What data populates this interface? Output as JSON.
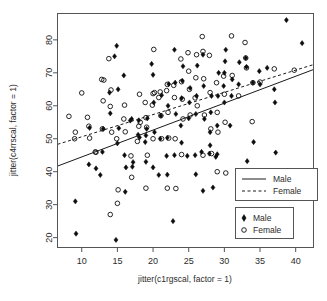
{
  "chart_data": {
    "type": "scatter",
    "title": "",
    "xlabel": "jitter(c1rgscal, factor = 1)",
    "ylabel": "jitter(c4rrscal, factor = 1)",
    "xlim": [
      6.6,
      42.5
    ],
    "ylim": [
      17.0,
      88.0
    ],
    "xticks": [
      10,
      15,
      20,
      25,
      30,
      35,
      40
    ],
    "yticks": [
      20,
      30,
      40,
      50,
      60,
      70,
      80
    ],
    "grid": false,
    "legend_position": "bottom-right",
    "legends": [
      {
        "name": "fit-lines-legend",
        "entries": [
          {
            "label": "Male",
            "style": "solid",
            "color": "#1a1a1a"
          },
          {
            "label": "Female",
            "style": "dashed",
            "color": "#1a1a1a"
          }
        ]
      },
      {
        "name": "points-legend",
        "entries": [
          {
            "label": "Male",
            "marker": "filled-diamond",
            "color": "#0d0d0d"
          },
          {
            "label": "Female",
            "marker": "open-circle",
            "color": "#0d0d0d"
          }
        ]
      }
    ],
    "fit_lines": [
      {
        "name": "Male",
        "style": "solid",
        "x": [
          6.6,
          42.5
        ],
        "y": [
          41.7,
          71.0
        ]
      },
      {
        "name": "Female",
        "style": "dashed",
        "x": [
          6.6,
          42.5
        ],
        "y": [
          48.3,
          72.5
        ]
      }
    ],
    "series": [
      {
        "name": "Male",
        "marker": "filled-diamond",
        "points": [
          [
            9.1,
            31.0
          ],
          [
            9.2,
            21.2
          ],
          [
            11.0,
            42.2
          ],
          [
            11.1,
            53.3
          ],
          [
            12.0,
            41.0
          ],
          [
            12.6,
            39.0
          ],
          [
            12.9,
            46.0
          ],
          [
            13.0,
            53.0
          ],
          [
            14.0,
            57.7
          ],
          [
            14.6,
            75.0
          ],
          [
            14.9,
            78.2
          ],
          [
            14.8,
            19.3
          ],
          [
            15.0,
            48.6
          ],
          [
            15.1,
            65.0
          ],
          [
            15.2,
            53.2
          ],
          [
            15.9,
            69.2
          ],
          [
            16.0,
            45.0
          ],
          [
            16.2,
            41.3
          ],
          [
            16.1,
            33.9
          ],
          [
            16.8,
            55.5
          ],
          [
            17.0,
            56.0
          ],
          [
            17.1,
            41.5
          ],
          [
            17.2,
            42.9
          ],
          [
            17.9,
            51.2
          ],
          [
            18.0,
            55.6
          ],
          [
            18.1,
            50.4
          ],
          [
            18.9,
            49.0
          ],
          [
            19.0,
            51.0
          ],
          [
            19.1,
            53.0
          ],
          [
            19.2,
            56.2
          ],
          [
            19.0,
            43.0
          ],
          [
            19.8,
            72.7
          ],
          [
            20.0,
            69.4
          ],
          [
            20.1,
            61.0
          ],
          [
            20.2,
            52.0
          ],
          [
            20.0,
            41.3
          ],
          [
            20.8,
            39.0
          ],
          [
            21.0,
            50.0
          ],
          [
            21.1,
            57.0
          ],
          [
            21.2,
            63.2
          ],
          [
            21.9,
            44.8
          ],
          [
            22.0,
            50.3
          ],
          [
            22.1,
            60.0
          ],
          [
            22.2,
            66.6
          ],
          [
            22.0,
            39.1
          ],
          [
            22.8,
            25.0
          ],
          [
            23.0,
            77.0
          ],
          [
            23.1,
            67.0
          ],
          [
            23.2,
            57.5
          ],
          [
            23.0,
            45.0
          ],
          [
            23.9,
            54.0
          ],
          [
            24.0,
            62.3
          ],
          [
            24.1,
            67.6
          ],
          [
            24.2,
            72.0
          ],
          [
            24.0,
            48.8
          ],
          [
            24.8,
            44.8
          ],
          [
            25.0,
            56.2
          ],
          [
            25.1,
            61.0
          ],
          [
            25.2,
            65.4
          ],
          [
            25.9,
            45.0
          ],
          [
            26.0,
            57.5
          ],
          [
            26.1,
            63.0
          ],
          [
            26.2,
            72.2
          ],
          [
            26.0,
            39.2
          ],
          [
            26.8,
            46.0
          ],
          [
            27.0,
            75.5
          ],
          [
            27.1,
            66.0
          ],
          [
            27.2,
            56.0
          ],
          [
            27.0,
            34.2
          ],
          [
            27.9,
            45.5
          ],
          [
            28.0,
            52.0
          ],
          [
            28.1,
            58.0
          ],
          [
            28.2,
            63.0
          ],
          [
            28.0,
            48.0
          ],
          [
            28.4,
            35.2
          ],
          [
            28.8,
            44.5
          ],
          [
            29.0,
            54.0
          ],
          [
            29.1,
            63.0
          ],
          [
            29.2,
            70.0
          ],
          [
            29.0,
            45.3
          ],
          [
            29.9,
            66.0
          ],
          [
            30.0,
            70.0
          ],
          [
            30.1,
            73.5
          ],
          [
            30.2,
            77.0
          ],
          [
            30.0,
            61.0
          ],
          [
            30.8,
            54.0
          ],
          [
            31.0,
            63.0
          ],
          [
            31.1,
            68.0
          ],
          [
            32.0,
            66.5
          ],
          [
            32.1,
            73.2
          ],
          [
            33.0,
            74.5
          ],
          [
            33.1,
            71.8
          ],
          [
            33.2,
            43.2
          ],
          [
            34.0,
            67.0
          ],
          [
            34.1,
            49.0
          ],
          [
            34.9,
            70.5
          ],
          [
            35.0,
            66.5
          ],
          [
            36.0,
            71.5
          ],
          [
            37.0,
            65.0
          ],
          [
            37.1,
            61.0
          ],
          [
            37.2,
            45.8
          ],
          [
            38.7,
            86.0
          ],
          [
            40.9,
            79.0
          ],
          [
            13.9,
            64.0
          ]
        ]
      },
      {
        "name": "Female",
        "marker": "open-circle",
        "points": [
          [
            8.2,
            56.8
          ],
          [
            9.0,
            50.0
          ],
          [
            9.1,
            52.0
          ],
          [
            10.0,
            63.9
          ],
          [
            10.8,
            56.5
          ],
          [
            11.0,
            53.8
          ],
          [
            11.1,
            50.2
          ],
          [
            11.9,
            46.0
          ],
          [
            12.0,
            45.9
          ],
          [
            12.9,
            53.0
          ],
          [
            13.0,
            61.5
          ],
          [
            13.1,
            67.8
          ],
          [
            13.8,
            74.3
          ],
          [
            14.0,
            59.8
          ],
          [
            14.1,
            64.8
          ],
          [
            14.2,
            52.0
          ],
          [
            14.0,
            27.0
          ],
          [
            14.9,
            50.0
          ],
          [
            15.0,
            30.4
          ],
          [
            15.1,
            34.5
          ],
          [
            15.9,
            56.0
          ],
          [
            16.0,
            60.2
          ],
          [
            16.1,
            52.1
          ],
          [
            16.9,
            44.8
          ],
          [
            17.0,
            38.3
          ],
          [
            17.8,
            49.2
          ],
          [
            18.0,
            53.8
          ],
          [
            18.1,
            63.5
          ],
          [
            18.2,
            55.0
          ],
          [
            18.9,
            61.0
          ],
          [
            19.0,
            56.4
          ],
          [
            19.1,
            53.5
          ],
          [
            19.2,
            45.0
          ],
          [
            19.9,
            60.2
          ],
          [
            20.0,
            63.7
          ],
          [
            20.1,
            77.1
          ],
          [
            20.2,
            64.0
          ],
          [
            20.0,
            50.0
          ],
          [
            20.8,
            62.5
          ],
          [
            21.0,
            64.2
          ],
          [
            21.1,
            57.0
          ],
          [
            21.2,
            50.0
          ],
          [
            21.9,
            64.6
          ],
          [
            22.0,
            66.5
          ],
          [
            22.1,
            58.0
          ],
          [
            22.2,
            50.2
          ],
          [
            22.0,
            35.0
          ],
          [
            22.9,
            66.2
          ],
          [
            23.0,
            62.5
          ],
          [
            23.1,
            50.0
          ],
          [
            23.2,
            34.9
          ],
          [
            23.9,
            74.2
          ],
          [
            24.0,
            67.3
          ],
          [
            24.1,
            62.0
          ],
          [
            24.2,
            56.0
          ],
          [
            24.9,
            76.1
          ],
          [
            25.0,
            70.5
          ],
          [
            25.1,
            65.0
          ],
          [
            25.2,
            57.2
          ],
          [
            25.9,
            62.4
          ],
          [
            26.0,
            68.5
          ],
          [
            26.1,
            75.5
          ],
          [
            26.2,
            60.0
          ],
          [
            26.9,
            81.0
          ],
          [
            27.0,
            76.5
          ],
          [
            27.1,
            68.2
          ],
          [
            27.2,
            57.2
          ],
          [
            27.0,
            45.0
          ],
          [
            27.9,
            75.3
          ],
          [
            28.0,
            64.0
          ],
          [
            28.1,
            53.0
          ],
          [
            28.2,
            45.5
          ],
          [
            28.9,
            67.0
          ],
          [
            29.0,
            58.0
          ],
          [
            29.1,
            52.0
          ],
          [
            29.0,
            40.0
          ],
          [
            29.9,
            69.0
          ],
          [
            30.0,
            63.5
          ],
          [
            30.1,
            55.0
          ],
          [
            30.2,
            39.6
          ],
          [
            31.0,
            81.2
          ],
          [
            31.1,
            69.2
          ],
          [
            32.0,
            63.0
          ],
          [
            32.9,
            79.2
          ],
          [
            33.0,
            74.5
          ],
          [
            33.1,
            71.5
          ],
          [
            33.9,
            55.2
          ],
          [
            34.0,
            67.0
          ],
          [
            35.0,
            67.2
          ],
          [
            37.0,
            71.2
          ],
          [
            39.8,
            70.8
          ],
          [
            12.8,
            68.0
          ],
          [
            19.0,
            35.0
          ],
          [
            24.0,
            45.2
          ]
        ]
      }
    ]
  }
}
